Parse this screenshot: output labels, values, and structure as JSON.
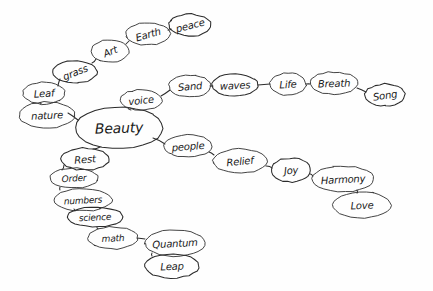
{
  "document": {
    "title": "Beauty concept map",
    "type": "hand-drawn mind map",
    "background_color": "#fefefe",
    "ink_color": "#2b2b2b"
  },
  "nodes": [
    {
      "id": "beauty",
      "label": "Beauty",
      "cx": 119,
      "cy": 128,
      "rx": 44,
      "ry": 21,
      "font_size": 14,
      "rotate": -2
    },
    {
      "id": "nature",
      "label": "nature",
      "cx": 47,
      "cy": 115,
      "rx": 28,
      "ry": 13,
      "font_size": 10,
      "rotate": -3
    },
    {
      "id": "leaf",
      "label": "Leaf",
      "cx": 44,
      "cy": 93,
      "rx": 21,
      "ry": 11,
      "font_size": 10,
      "rotate": -4
    },
    {
      "id": "grass",
      "label": "grass",
      "cx": 75,
      "cy": 72,
      "rx": 22,
      "ry": 11,
      "font_size": 10,
      "rotate": -22
    },
    {
      "id": "art",
      "label": "Art",
      "cx": 110,
      "cy": 51,
      "rx": 19,
      "ry": 11,
      "font_size": 10,
      "rotate": -22
    },
    {
      "id": "earth",
      "label": "Earth",
      "cx": 148,
      "cy": 34,
      "rx": 22,
      "ry": 11,
      "font_size": 10,
      "rotate": -16
    },
    {
      "id": "peace_t",
      "label": "peace",
      "cx": 190,
      "cy": 25,
      "rx": 21,
      "ry": 11,
      "font_size": 10,
      "rotate": -14
    },
    {
      "id": "voice",
      "label": "voice",
      "cx": 141,
      "cy": 100,
      "rx": 21,
      "ry": 10,
      "font_size": 10,
      "rotate": -6
    },
    {
      "id": "sand",
      "label": "Sand",
      "cx": 190,
      "cy": 86,
      "rx": 21,
      "ry": 11,
      "font_size": 10,
      "rotate": -5
    },
    {
      "id": "waves",
      "label": "waves",
      "cx": 235,
      "cy": 85,
      "rx": 23,
      "ry": 11,
      "font_size": 10,
      "rotate": -3
    },
    {
      "id": "life",
      "label": "Life",
      "cx": 288,
      "cy": 84,
      "rx": 18,
      "ry": 11,
      "font_size": 10,
      "rotate": -3
    },
    {
      "id": "breath",
      "label": "Breath",
      "cx": 334,
      "cy": 83,
      "rx": 24,
      "ry": 11,
      "font_size": 10,
      "rotate": -2
    },
    {
      "id": "song",
      "label": "Song",
      "cx": 385,
      "cy": 95,
      "rx": 20,
      "ry": 11,
      "font_size": 10,
      "rotate": -8
    },
    {
      "id": "people",
      "label": "people",
      "cx": 188,
      "cy": 146,
      "rx": 24,
      "ry": 11,
      "font_size": 10,
      "rotate": -4
    },
    {
      "id": "relief",
      "label": "Relief",
      "cx": 240,
      "cy": 161,
      "rx": 27,
      "ry": 12,
      "font_size": 10,
      "rotate": -5
    },
    {
      "id": "joy",
      "label": "Joy",
      "cx": 291,
      "cy": 170,
      "rx": 20,
      "ry": 12,
      "font_size": 10,
      "rotate": -5
    },
    {
      "id": "harmony",
      "label": "Harmony",
      "cx": 343,
      "cy": 179,
      "rx": 31,
      "ry": 13,
      "font_size": 10,
      "rotate": -3
    },
    {
      "id": "love",
      "label": "Love",
      "cx": 362,
      "cy": 205,
      "rx": 29,
      "ry": 13,
      "font_size": 10,
      "rotate": -3
    },
    {
      "id": "rest",
      "label": "Rest",
      "cx": 85,
      "cy": 159,
      "rx": 24,
      "ry": 11,
      "font_size": 10,
      "rotate": -4
    },
    {
      "id": "order",
      "label": "Order",
      "cx": 74,
      "cy": 178,
      "rx": 24,
      "ry": 10,
      "font_size": 9,
      "rotate": -3
    },
    {
      "id": "numbers",
      "label": "numbers",
      "cx": 83,
      "cy": 200,
      "rx": 29,
      "ry": 11,
      "font_size": 9,
      "rotate": -3
    },
    {
      "id": "science",
      "label": "science",
      "cx": 95,
      "cy": 217,
      "rx": 28,
      "ry": 10,
      "font_size": 9,
      "rotate": -3
    },
    {
      "id": "math",
      "label": "math",
      "cx": 113,
      "cy": 238,
      "rx": 25,
      "ry": 11,
      "font_size": 9,
      "rotate": -3
    },
    {
      "id": "quantum",
      "label": "Quantum",
      "cx": 175,
      "cy": 243,
      "rx": 30,
      "ry": 13,
      "font_size": 10,
      "rotate": -3
    },
    {
      "id": "leap",
      "label": "Leap",
      "cx": 172,
      "cy": 266,
      "rx": 27,
      "ry": 12,
      "font_size": 10,
      "rotate": -3
    }
  ],
  "edges": [
    {
      "from": "beauty",
      "to": "nature",
      "x1": 78,
      "y1": 120,
      "x2": 68,
      "y2": 113
    },
    {
      "from": "nature",
      "to": "leaf",
      "x1": 40,
      "y1": 103,
      "x2": 41,
      "y2": 104
    },
    {
      "from": "leaf",
      "to": "grass",
      "x1": 58,
      "y1": 86,
      "x2": 60,
      "y2": 79
    },
    {
      "from": "grass",
      "to": "art",
      "x1": 92,
      "y1": 63,
      "x2": 96,
      "y2": 59
    },
    {
      "from": "art",
      "to": "earth",
      "x1": 126,
      "y1": 44,
      "x2": 129,
      "y2": 41
    },
    {
      "from": "earth",
      "to": "peace_t",
      "x1": 168,
      "y1": 30,
      "x2": 171,
      "y2": 29
    },
    {
      "from": "beauty",
      "to": "voice",
      "x1": 128,
      "y1": 108,
      "x2": 131,
      "y2": 110
    },
    {
      "from": "voice",
      "to": "sand",
      "x1": 161,
      "y1": 96,
      "x2": 170,
      "y2": 90
    },
    {
      "from": "sand",
      "to": "waves",
      "x1": 210,
      "y1": 86,
      "x2": 213,
      "y2": 86
    },
    {
      "from": "waves",
      "to": "life",
      "x1": 258,
      "y1": 85,
      "x2": 270,
      "y2": 84
    },
    {
      "from": "life",
      "to": "breath",
      "x1": 306,
      "y1": 84,
      "x2": 310,
      "y2": 84
    },
    {
      "from": "breath",
      "to": "song",
      "x1": 357,
      "y1": 88,
      "x2": 366,
      "y2": 92
    },
    {
      "from": "beauty",
      "to": "people",
      "x1": 153,
      "y1": 138,
      "x2": 165,
      "y2": 144
    },
    {
      "from": "people",
      "to": "relief",
      "x1": 209,
      "y1": 152,
      "x2": 214,
      "y2": 155
    },
    {
      "from": "relief",
      "to": "joy",
      "x1": 266,
      "y1": 166,
      "x2": 272,
      "y2": 168
    },
    {
      "from": "joy",
      "to": "harmony",
      "x1": 310,
      "y1": 174,
      "x2": 313,
      "y2": 176
    },
    {
      "from": "harmony",
      "to": "love",
      "x1": 357,
      "y1": 190,
      "x2": 357,
      "y2": 193
    },
    {
      "from": "beauty",
      "to": "rest",
      "x1": 100,
      "y1": 147,
      "x2": 93,
      "y2": 149
    },
    {
      "from": "rest",
      "to": "order",
      "x1": 64,
      "y1": 165,
      "x2": 62,
      "y2": 170
    },
    {
      "from": "order",
      "to": "numbers",
      "x1": 60,
      "y1": 187,
      "x2": 60,
      "y2": 190
    },
    {
      "from": "numbers",
      "to": "science",
      "x1": 74,
      "y1": 209,
      "x2": 75,
      "y2": 211
    },
    {
      "from": "science",
      "to": "math",
      "x1": 97,
      "y1": 227,
      "x2": 98,
      "y2": 229
    },
    {
      "from": "math",
      "to": "quantum",
      "x1": 137,
      "y1": 238,
      "x2": 145,
      "y2": 239
    },
    {
      "from": "quantum",
      "to": "leap",
      "x1": 152,
      "y1": 253,
      "x2": 152,
      "y2": 256
    }
  ]
}
